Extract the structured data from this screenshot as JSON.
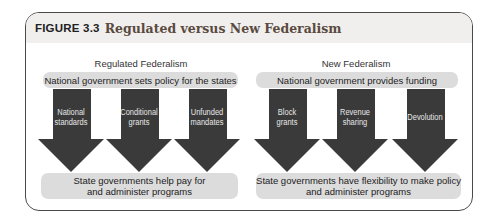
{
  "figure": {
    "number": "FIGURE 3.3",
    "title": "Regulated versus New Federalism"
  },
  "colors": {
    "header_bg": "#f0efee",
    "title_color": "#5a4a3e",
    "pill_bg": "#dcdcdc",
    "arrow_fill": "#3a3a3a",
    "frame_border": "#4a4a4a"
  },
  "panels": [
    {
      "title": "Regulated Federalism",
      "top_box": "National government sets policy for the states",
      "arrows": [
        {
          "line1": "National",
          "line2": "standards"
        },
        {
          "line1": "Conditional",
          "line2": "grants"
        },
        {
          "line1": "Unfunded",
          "line2": "mandates"
        }
      ],
      "bottom_box": {
        "line1": "State governments help pay for",
        "line2": "and administer programs"
      }
    },
    {
      "title": "New Federalism",
      "top_box": "National government provides funding",
      "arrows": [
        {
          "line1": "Block",
          "line2": "grants"
        },
        {
          "line1": "Revenue",
          "line2": "sharing"
        },
        {
          "line1": "Devolution",
          "line2": ""
        }
      ],
      "bottom_box": {
        "line1": "State governments have flexibility to make policy",
        "line2": "and administer programs"
      }
    }
  ]
}
